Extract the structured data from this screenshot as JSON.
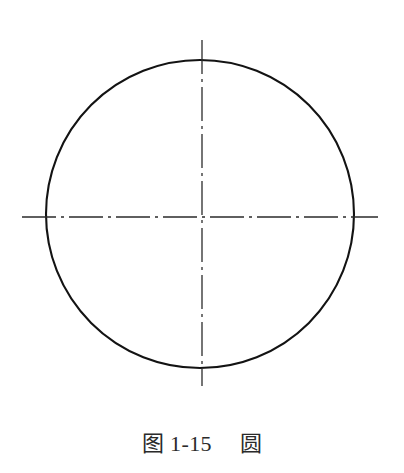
{
  "page": {
    "background_color": "#ffffff",
    "width": 404,
    "height": 473
  },
  "figure": {
    "ink_color": "#1a1a1a",
    "centerline_color": "#2b2b2b",
    "drawing": {
      "type": "technical-drawing",
      "shape_name": "circle",
      "circle": {
        "center_x": 200,
        "center_y": 214,
        "radius": 154,
        "stroke_width": 2.1,
        "stroke_color": "#131313",
        "fill": "none"
      },
      "centerlines": [
        {
          "name": "horizontal-centerline",
          "orientation": "horizontal",
          "y": 217,
          "x_start": 22,
          "x_end": 378,
          "stroke_width": 1.3,
          "pattern": "dash-dot",
          "dash_array": "34 5 3 5"
        },
        {
          "name": "vertical-centerline",
          "orientation": "vertical",
          "x": 202,
          "y_start": 40,
          "y_end": 386,
          "stroke_width": 1.3,
          "pattern": "dash-dot",
          "dash_array": "34 5 3 5"
        }
      ]
    }
  },
  "caption": {
    "full_text": "图 1-15　圆",
    "label": "图",
    "number": "1-15",
    "title": "圆",
    "color": "#2a2a2a",
    "font_size_px": 22
  }
}
